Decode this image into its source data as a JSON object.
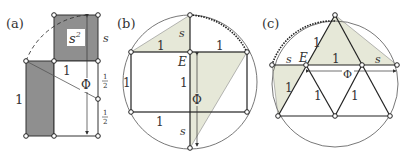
{
  "figure": {
    "colors": {
      "dark_fill": "#8f8f8f",
      "light_fill": "#e6e8d8",
      "stroke": "#333333",
      "circle": "#555555"
    },
    "panel_a": {
      "label": "(a)",
      "square_label_base": "s",
      "square_label_exp": "2",
      "side_s": "s",
      "top_one": "1",
      "left_one": "1",
      "phi": "Φ",
      "half_top_num": "1",
      "half_top_den": "2",
      "half_bot_num": "1",
      "half_bot_den": "2"
    },
    "panel_b": {
      "label": "(b)",
      "s_top": "s",
      "one_top_left": "1",
      "one_top_right": "1",
      "E": "E",
      "one_left": "1",
      "one_center": "1",
      "phi": "Φ",
      "one_bottom": "1",
      "s_bottom": "s"
    },
    "panel_c": {
      "label": "(c)",
      "s_left": "s",
      "E": "E",
      "one_top": "1",
      "one_upper_left": "1",
      "s_right": "s",
      "phi": "Φ",
      "one_lower_left": "1",
      "one_mid_left": "1",
      "one_mid_right": "1"
    }
  }
}
